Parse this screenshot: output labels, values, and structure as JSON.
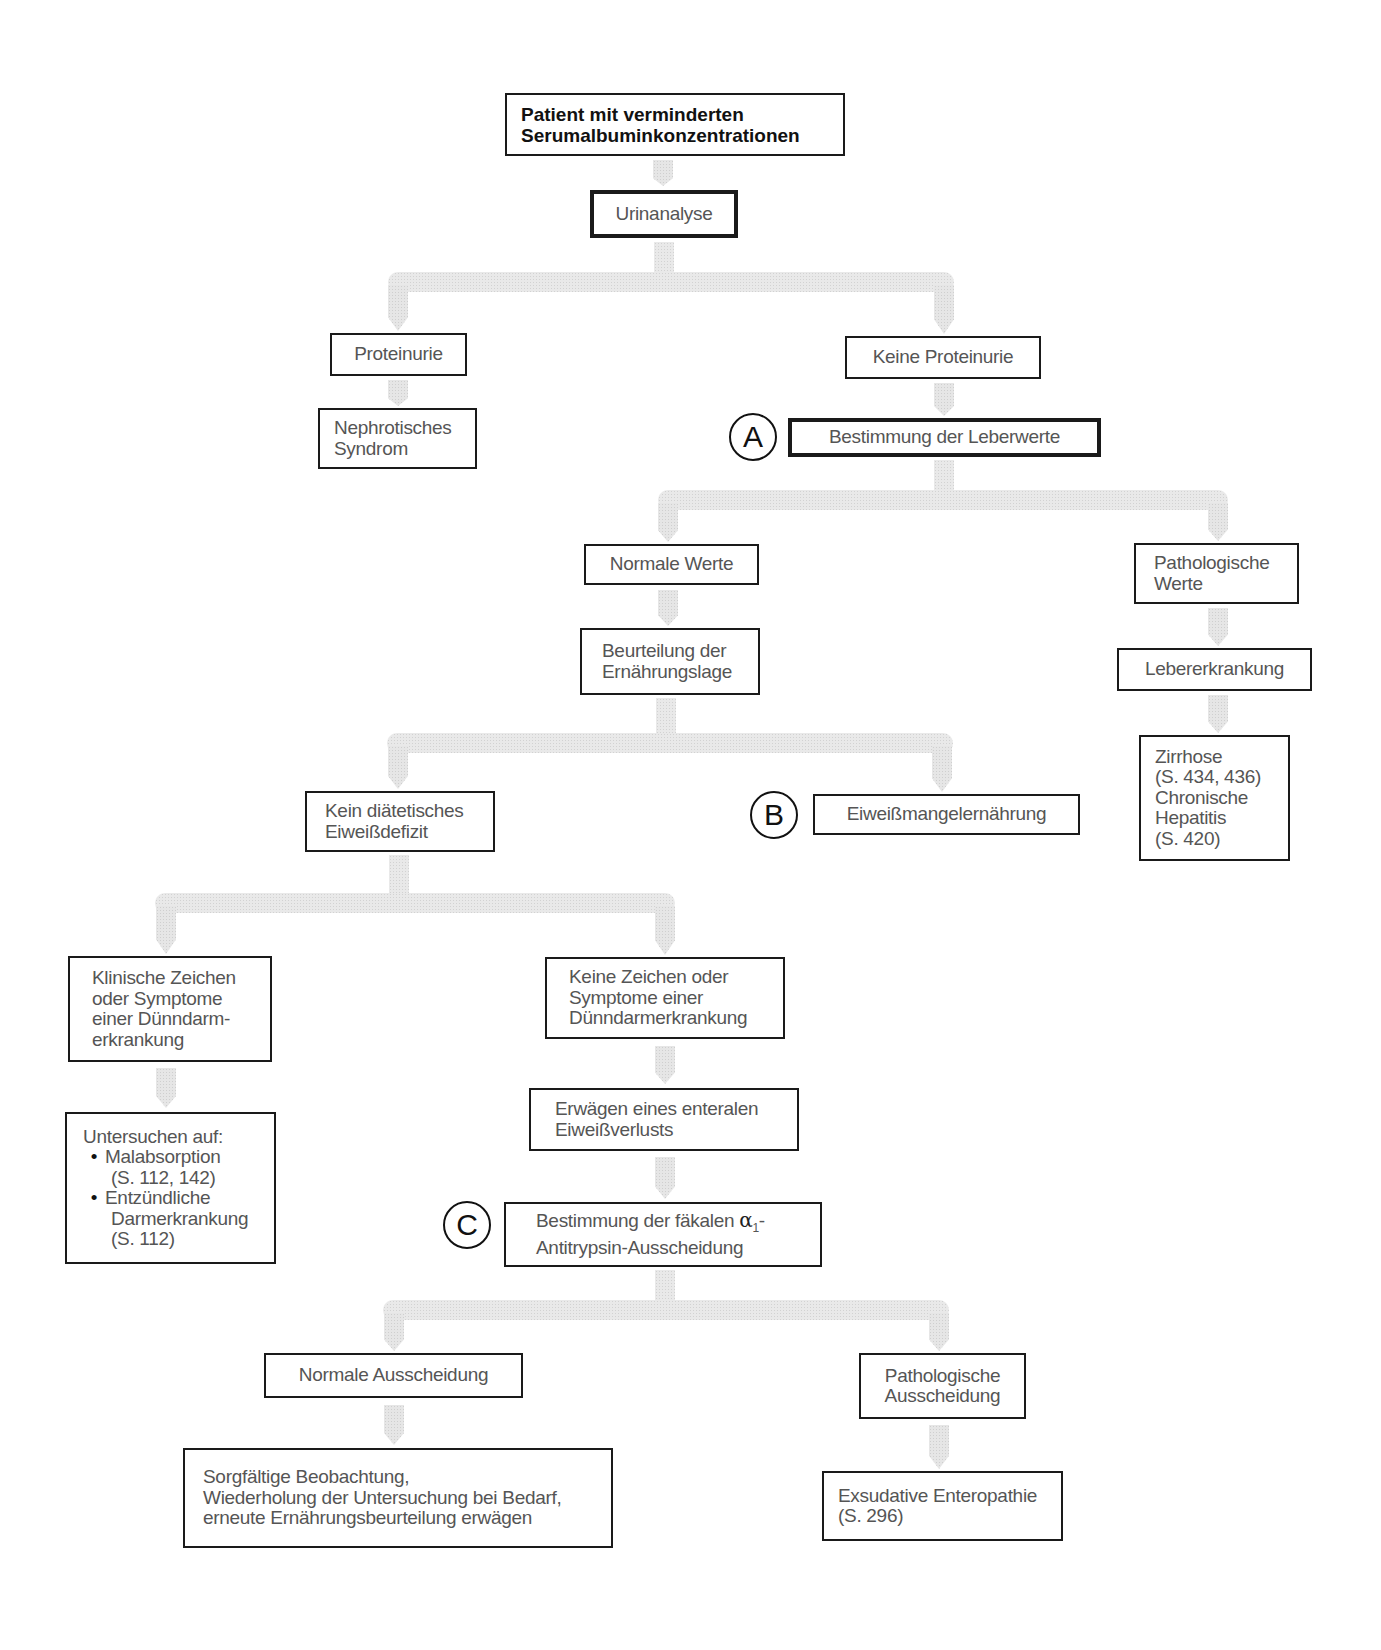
{
  "diagram": {
    "type": "flowchart",
    "language": "de",
    "root": {
      "lines": [
        "Patient mit verminderten",
        "Serumalbuminkonzentrationen"
      ]
    },
    "nodes": {
      "urinanalyse": {
        "lines": [
          "Urinanalyse"
        ]
      },
      "proteinurie": {
        "lines": [
          "Proteinurie"
        ]
      },
      "keine_proteinurie": {
        "lines": [
          "Keine Proteinurie"
        ]
      },
      "nephrotisches": {
        "lines": [
          "Nephrotisches",
          "Syndrom"
        ]
      },
      "leberwerte": {
        "marker": "A",
        "lines": [
          "Bestimmung der Leberwerte"
        ]
      },
      "normale_werte": {
        "lines": [
          "Normale Werte"
        ]
      },
      "pathologische_werte": {
        "lines": [
          "Pathologische",
          "Werte"
        ]
      },
      "beurteilung": {
        "lines": [
          "Beurteilung der",
          "Ernährungslage"
        ]
      },
      "lebererkrankung": {
        "lines": [
          "Lebererkrankung"
        ]
      },
      "zirrhose": {
        "lines": [
          "Zirrhose",
          "(S. 434, 436)",
          "Chronische",
          "Hepatitis",
          "(S. 420)"
        ]
      },
      "kein_defizit": {
        "lines": [
          "Kein diätetisches",
          "Eiweißdefizit"
        ]
      },
      "eiweissmangel": {
        "marker": "B",
        "lines": [
          "Eiweißmangelernährung"
        ]
      },
      "klinische_zeichen": {
        "lines": [
          "Klinische Zeichen",
          "oder Symptome",
          "einer Dünndarm-",
          "erkrankung"
        ]
      },
      "keine_zeichen": {
        "lines": [
          "Keine Zeichen oder",
          "Symptome einer",
          "Dünndarmerkrankung"
        ]
      },
      "untersuchen": {
        "heading": "Untersuchen auf:",
        "bullets": [
          {
            "label": "Malabsorption",
            "sub": [
              "(S. 112, 142)"
            ]
          },
          {
            "label": "Entzündliche",
            "sub": [
              "Darmerkrankung",
              "(S. 112)"
            ]
          }
        ],
        "bullet_char": "•"
      },
      "erwaegen": {
        "lines": [
          "Erwägen eines enteralen",
          "Eiweißverlusts"
        ]
      },
      "alpha1": {
        "marker": "C",
        "line1_prefix": "Bestimmung der fäkalen ",
        "alpha": "α",
        "subscript": "1",
        "line1_suffix": "-",
        "line2": "Antitrypsin-Ausscheidung"
      },
      "normale_ausscheidung": {
        "lines": [
          "Normale Ausscheidung"
        ]
      },
      "pathologische_ausscheidung": {
        "lines": [
          "Pathologische",
          "Ausscheidung"
        ]
      },
      "sorgfaeltige": {
        "lines": [
          "Sorgfältige Beobachtung,",
          "Wiederholung der Untersuchung bei Bedarf,",
          "erneute Ernährungsbeurteilung erwägen"
        ]
      },
      "exsudative": {
        "lines": [
          "Exsudative Enteropathie",
          "(S. 296)"
        ]
      }
    },
    "edges": [
      [
        "root",
        "urinanalyse"
      ],
      [
        "urinanalyse",
        "proteinurie"
      ],
      [
        "urinanalyse",
        "keine_proteinurie"
      ],
      [
        "proteinurie",
        "nephrotisches"
      ],
      [
        "keine_proteinurie",
        "leberwerte"
      ],
      [
        "leberwerte",
        "normale_werte"
      ],
      [
        "leberwerte",
        "pathologische_werte"
      ],
      [
        "normale_werte",
        "beurteilung"
      ],
      [
        "pathologische_werte",
        "lebererkrankung"
      ],
      [
        "lebererkrankung",
        "zirrhose"
      ],
      [
        "beurteilung",
        "kein_defizit"
      ],
      [
        "beurteilung",
        "eiweissmangel"
      ],
      [
        "kein_defizit",
        "klinische_zeichen"
      ],
      [
        "kein_defizit",
        "keine_zeichen"
      ],
      [
        "klinische_zeichen",
        "untersuchen"
      ],
      [
        "keine_zeichen",
        "erwaegen"
      ],
      [
        "erwaegen",
        "alpha1"
      ],
      [
        "alpha1",
        "normale_ausscheidung"
      ],
      [
        "alpha1",
        "pathologische_ausscheidung"
      ],
      [
        "normale_ausscheidung",
        "sorgfaeltige"
      ],
      [
        "pathologische_ausscheidung",
        "exsudative"
      ]
    ],
    "colors": {
      "border": "#1a1a1a",
      "text": "#555555",
      "root_text": "#111111",
      "connector": "#e6e6e6"
    }
  }
}
